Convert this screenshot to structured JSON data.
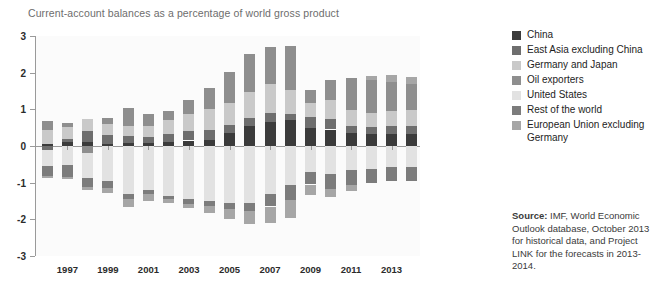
{
  "title": "Current-account balances as a percentage of world gross product",
  "legend": {
    "items": [
      {
        "label": "China",
        "color": "#3b3b3b"
      },
      {
        "label": "East Asia excluding China",
        "color": "#6e6e6e"
      },
      {
        "label": "Germany and Japan",
        "color": "#c9c9c9"
      },
      {
        "label": "Oil exporters",
        "color": "#8e8e8e"
      },
      {
        "label": "United States",
        "color": "#e2e2e2"
      },
      {
        "label": "Rest of the world",
        "color": "#7c7c7c"
      },
      {
        "label": "European Union excluding Germany",
        "color": "#a6a6a6"
      }
    ]
  },
  "source": {
    "prefix": "Source:",
    "text": "  IMF, World Economic Outlook database, October 2013 for historical data, and Project LINK for the forecasts in 2013-2014."
  },
  "chart_data": {
    "type": "bar",
    "stacked": true,
    "title": "Current-account balances as a percentage of world gross product",
    "xlabel": "",
    "ylabel": "",
    "ylim": [
      -3,
      3
    ],
    "yticks": [
      3,
      2,
      1,
      0,
      -1,
      -2,
      -3
    ],
    "grid": false,
    "legend_position": "right",
    "units": "percentage of world gross product",
    "x": [
      1996,
      1997,
      1998,
      1999,
      2000,
      2001,
      2002,
      2003,
      2004,
      2005,
      2006,
      2007,
      2008,
      2009,
      2010,
      2011,
      2012,
      2013,
      2014
    ],
    "tick_labels": [
      "1997",
      "1999",
      "2001",
      "2003",
      "2005",
      "2007",
      "2009",
      "2011",
      "2013"
    ],
    "tick_years": [
      1997,
      1999,
      2001,
      2003,
      2005,
      2007,
      2009,
      2011,
      2013
    ],
    "series": [
      {
        "name": "China",
        "color": "#3b3b3b",
        "values": [
          0.05,
          0.12,
          0.12,
          0.06,
          0.07,
          0.07,
          0.11,
          0.15,
          0.17,
          0.35,
          0.55,
          0.65,
          0.72,
          0.5,
          0.45,
          0.35,
          0.33,
          0.33,
          0.33
        ]
      },
      {
        "name": "East Asia excluding China",
        "color": "#6e6e6e",
        "values": [
          -0.1,
          0.06,
          0.28,
          0.25,
          0.2,
          0.17,
          0.22,
          0.25,
          0.27,
          0.22,
          0.22,
          0.25,
          0.16,
          0.28,
          0.28,
          0.2,
          0.2,
          0.22,
          0.22
        ]
      },
      {
        "name": "Germany and Japan",
        "color": "#c9c9c9",
        "values": [
          0.38,
          0.33,
          0.34,
          0.3,
          0.28,
          0.3,
          0.38,
          0.47,
          0.58,
          0.6,
          0.7,
          0.8,
          0.66,
          0.4,
          0.52,
          0.42,
          0.36,
          0.4,
          0.42
        ]
      },
      {
        "name": "Oil exporters",
        "color": "#8e8e8e",
        "values": [
          0.25,
          0.12,
          -0.18,
          0.15,
          0.5,
          0.32,
          0.25,
          0.38,
          0.55,
          0.85,
          1.05,
          1.0,
          1.2,
          0.35,
          0.55,
          0.88,
          0.92,
          0.8,
          0.72
        ]
      },
      {
        "name": "United States",
        "color": "#e2e2e2",
        "values": [
          -0.45,
          -0.52,
          -0.7,
          -0.95,
          -1.3,
          -1.2,
          -1.35,
          -1.45,
          -1.5,
          -1.55,
          -1.55,
          -1.3,
          -1.05,
          -0.7,
          -0.75,
          -0.65,
          -0.62,
          -0.58,
          -0.58
        ]
      },
      {
        "name": "Rest of the world",
        "color": "#7c7c7c",
        "values": [
          -0.28,
          -0.32,
          -0.25,
          -0.2,
          -0.15,
          -0.12,
          -0.1,
          -0.12,
          -0.14,
          -0.18,
          -0.22,
          -0.35,
          -0.42,
          -0.35,
          -0.42,
          -0.42,
          -0.4,
          -0.38,
          -0.38
        ]
      },
      {
        "name": "European Union excluding Germany",
        "color": "#a6a6a6",
        "values": [
          -0.05,
          -0.05,
          -0.08,
          -0.12,
          -0.22,
          -0.18,
          -0.1,
          -0.12,
          -0.18,
          -0.25,
          -0.35,
          -0.45,
          -0.5,
          -0.28,
          -0.22,
          -0.15,
          0.1,
          0.18,
          0.2
        ]
      }
    ]
  }
}
